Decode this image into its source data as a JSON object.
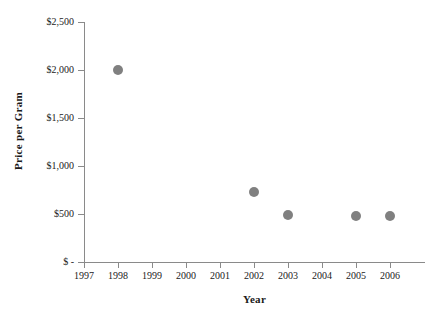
{
  "chart_data": {
    "type": "scatter",
    "title": "",
    "xlabel": "Year",
    "ylabel": "Price per Gram",
    "grid": false,
    "legend": "none",
    "marker_color": "#808080",
    "axis_color": "#8a8a8a",
    "xlim": [
      1997,
      2006
    ],
    "ylim": [
      0,
      2500
    ],
    "x_tick_labels": [
      "1997",
      "1998",
      "1999",
      "2000",
      "2001",
      "2002",
      "2003",
      "2004",
      "2005",
      "2006"
    ],
    "x_tick_values": [
      1997,
      1998,
      1999,
      2000,
      2001,
      2002,
      2003,
      2004,
      2005,
      2006
    ],
    "y_tick_labels": [
      "$2,500",
      "$2,000",
      "$1,500",
      "$1,000",
      "$500",
      "$ -"
    ],
    "y_tick_values": [
      2500,
      2000,
      1500,
      1000,
      500,
      0
    ],
    "x": [
      1998,
      2002,
      2003,
      2005,
      2006
    ],
    "values": [
      2000,
      725,
      490,
      480,
      480
    ],
    "points": [
      {
        "label": "1998",
        "x": 1998,
        "y": 2000
      },
      {
        "label": "2002",
        "x": 2002,
        "y": 725
      },
      {
        "label": "2003",
        "x": 2003,
        "y": 490
      },
      {
        "label": "2005",
        "x": 2005,
        "y": 480
      },
      {
        "label": "2006",
        "x": 2006,
        "y": 480
      }
    ]
  }
}
